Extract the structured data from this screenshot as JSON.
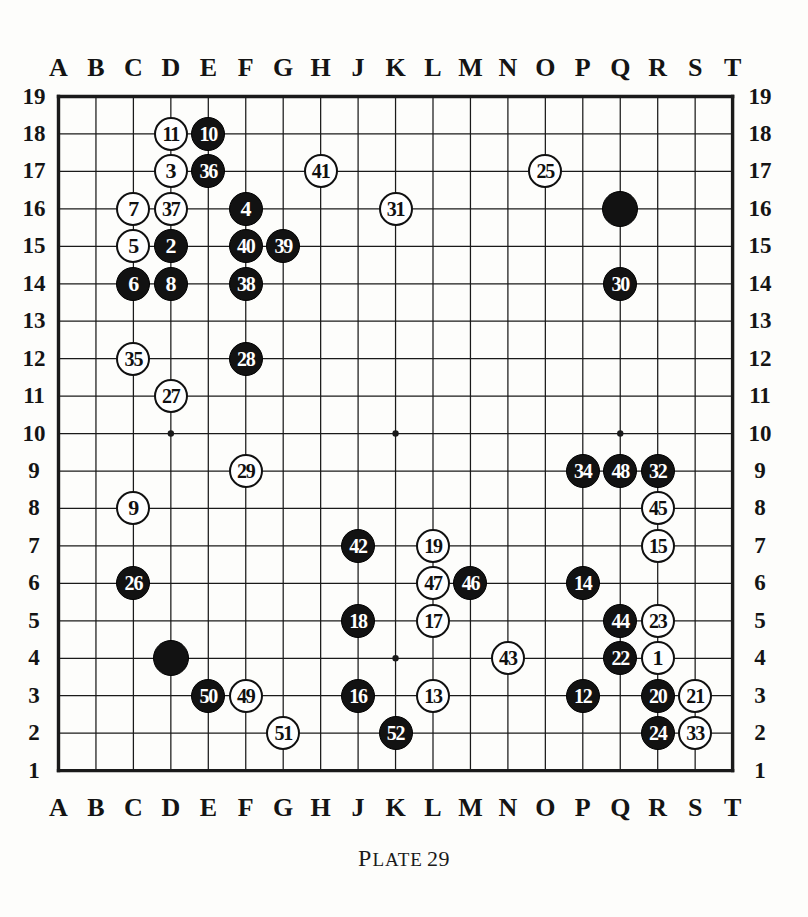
{
  "caption": {
    "plate_label": "Plate",
    "plate_number": "29"
  },
  "board": {
    "size": 19,
    "column_labels": [
      "A",
      "B",
      "C",
      "D",
      "E",
      "F",
      "G",
      "H",
      "J",
      "K",
      "L",
      "M",
      "N",
      "O",
      "P",
      "Q",
      "R",
      "S",
      "T"
    ],
    "row_labels": [
      "19",
      "18",
      "17",
      "16",
      "15",
      "14",
      "13",
      "12",
      "11",
      "10",
      "9",
      "8",
      "7",
      "6",
      "5",
      "4",
      "3",
      "2",
      "1"
    ],
    "star_points": [
      "D16",
      "K16",
      "Q16",
      "D10",
      "K10",
      "Q10",
      "D4",
      "K4",
      "Q4"
    ],
    "colors": {
      "black": "#121212",
      "white": "#ffffff",
      "line": "#1a1a1a",
      "background": "#fdfdfb"
    }
  },
  "stones": [
    {
      "label": "11",
      "color": "white",
      "col": "D",
      "row": 18
    },
    {
      "label": "10",
      "color": "black",
      "col": "E",
      "row": 18
    },
    {
      "label": "3",
      "color": "white",
      "col": "D",
      "row": 17
    },
    {
      "label": "36",
      "color": "black",
      "col": "E",
      "row": 17
    },
    {
      "label": "41",
      "color": "white",
      "col": "H",
      "row": 17
    },
    {
      "label": "25",
      "color": "white",
      "col": "O",
      "row": 17
    },
    {
      "label": "7",
      "color": "white",
      "col": "C",
      "row": 16
    },
    {
      "label": "37",
      "color": "white",
      "col": "D",
      "row": 16
    },
    {
      "label": "4",
      "color": "black",
      "col": "F",
      "row": 16
    },
    {
      "label": "31",
      "color": "white",
      "col": "K",
      "row": 16
    },
    {
      "label": "",
      "color": "black",
      "col": "Q",
      "row": 16
    },
    {
      "label": "5",
      "color": "white",
      "col": "C",
      "row": 15
    },
    {
      "label": "2",
      "color": "black",
      "col": "D",
      "row": 15
    },
    {
      "label": "40",
      "color": "black",
      "col": "F",
      "row": 15
    },
    {
      "label": "39",
      "color": "black",
      "col": "G",
      "row": 15
    },
    {
      "label": "6",
      "color": "black",
      "col": "C",
      "row": 14
    },
    {
      "label": "8",
      "color": "black",
      "col": "D",
      "row": 14
    },
    {
      "label": "38",
      "color": "black",
      "col": "F",
      "row": 14
    },
    {
      "label": "30",
      "color": "black",
      "col": "Q",
      "row": 14
    },
    {
      "label": "35",
      "color": "white",
      "col": "C",
      "row": 12
    },
    {
      "label": "28",
      "color": "black",
      "col": "F",
      "row": 12
    },
    {
      "label": "27",
      "color": "white",
      "col": "D",
      "row": 11
    },
    {
      "label": "29",
      "color": "white",
      "col": "F",
      "row": 9
    },
    {
      "label": "34",
      "color": "black",
      "col": "P",
      "row": 9
    },
    {
      "label": "48",
      "color": "black",
      "col": "Q",
      "row": 9
    },
    {
      "label": "32",
      "color": "black",
      "col": "R",
      "row": 9
    },
    {
      "label": "9",
      "color": "white",
      "col": "C",
      "row": 8
    },
    {
      "label": "45",
      "color": "white",
      "col": "R",
      "row": 8
    },
    {
      "label": "42",
      "color": "black",
      "col": "J",
      "row": 7
    },
    {
      "label": "19",
      "color": "white",
      "col": "L",
      "row": 7
    },
    {
      "label": "15",
      "color": "white",
      "col": "R",
      "row": 7
    },
    {
      "label": "26",
      "color": "black",
      "col": "C",
      "row": 6
    },
    {
      "label": "47",
      "color": "white",
      "col": "L",
      "row": 6
    },
    {
      "label": "46",
      "color": "black",
      "col": "M",
      "row": 6
    },
    {
      "label": "14",
      "color": "black",
      "col": "P",
      "row": 6
    },
    {
      "label": "18",
      "color": "black",
      "col": "J",
      "row": 5
    },
    {
      "label": "17",
      "color": "white",
      "col": "L",
      "row": 5
    },
    {
      "label": "44",
      "color": "black",
      "col": "Q",
      "row": 5
    },
    {
      "label": "23",
      "color": "white",
      "col": "R",
      "row": 5
    },
    {
      "label": "",
      "color": "black",
      "col": "D",
      "row": 4
    },
    {
      "label": "43",
      "color": "white",
      "col": "N",
      "row": 4
    },
    {
      "label": "22",
      "color": "black",
      "col": "Q",
      "row": 4
    },
    {
      "label": "1",
      "color": "white",
      "col": "R",
      "row": 4
    },
    {
      "label": "50",
      "color": "black",
      "col": "E",
      "row": 3
    },
    {
      "label": "49",
      "color": "white",
      "col": "F",
      "row": 3
    },
    {
      "label": "16",
      "color": "black",
      "col": "J",
      "row": 3
    },
    {
      "label": "13",
      "color": "white",
      "col": "L",
      "row": 3
    },
    {
      "label": "12",
      "color": "black",
      "col": "P",
      "row": 3
    },
    {
      "label": "20",
      "color": "black",
      "col": "R",
      "row": 3
    },
    {
      "label": "21",
      "color": "white",
      "col": "S",
      "row": 3
    },
    {
      "label": "51",
      "color": "white",
      "col": "G",
      "row": 2
    },
    {
      "label": "52",
      "color": "black",
      "col": "K",
      "row": 2
    },
    {
      "label": "24",
      "color": "black",
      "col": "R",
      "row": 2
    },
    {
      "label": "33",
      "color": "white",
      "col": "S",
      "row": 2
    }
  ]
}
